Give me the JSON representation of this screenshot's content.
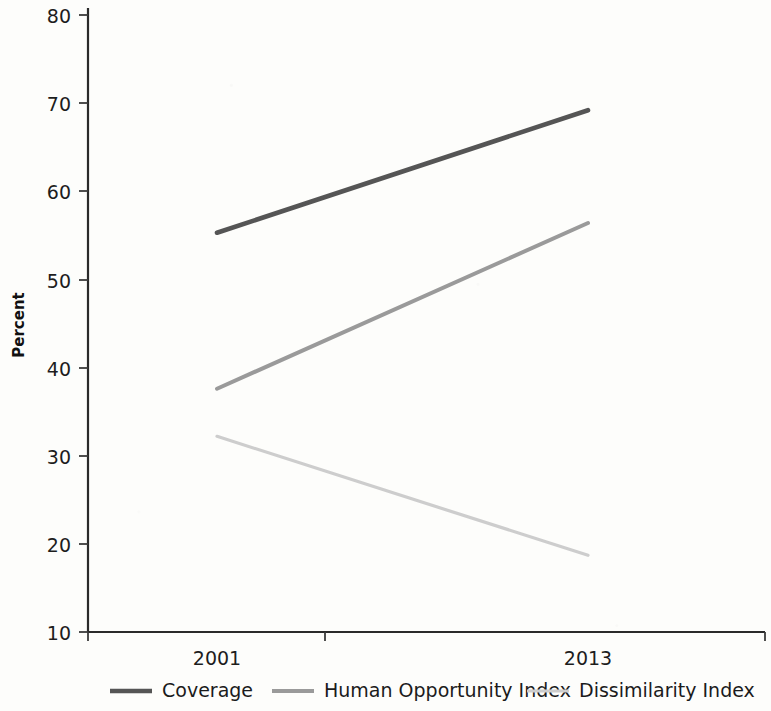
{
  "chart_data": {
    "type": "line",
    "title": "",
    "subtitle": "",
    "xlabel": "",
    "ylabel": "Percent",
    "categories": [
      "2001",
      "2013"
    ],
    "x": [
      2001,
      2013
    ],
    "xlim": [
      2001,
      2013
    ],
    "ylim": [
      10,
      80
    ],
    "ytick_labels": [
      "10",
      "20",
      "30",
      "40",
      "50",
      "60",
      "70",
      "80"
    ],
    "yticks": [
      10,
      20,
      30,
      40,
      50,
      60,
      70,
      80
    ],
    "xtick_labels": [
      "2001",
      "2013"
    ],
    "grid": false,
    "legend_position": "bottom",
    "series": [
      {
        "name": "Coverage",
        "values": [
          55.3,
          69.2
        ],
        "color": "#555555"
      },
      {
        "name": "Human Opportunity Index",
        "values": [
          37.6,
          56.4
        ],
        "color": "#9a9a9a"
      },
      {
        "name": "Dissimilarity Index",
        "values": [
          32.2,
          18.7
        ],
        "color": "#cdcdcd"
      }
    ]
  },
  "axes": {
    "y_title": "Percent",
    "y_ticks": [
      {
        "label": "80",
        "value": 80
      },
      {
        "label": "70",
        "value": 70
      },
      {
        "label": "60",
        "value": 60
      },
      {
        "label": "50",
        "value": 50
      },
      {
        "label": "40",
        "value": 40
      },
      {
        "label": "30",
        "value": 30
      },
      {
        "label": "20",
        "value": 20
      },
      {
        "label": "10",
        "value": 10
      }
    ],
    "x_ticks": [
      {
        "label": "2001",
        "value": 2001
      },
      {
        "label": "2013",
        "value": 2013
      }
    ]
  },
  "legend": {
    "items": [
      {
        "label": "Coverage",
        "color": "#555555",
        "thickness": 4.6
      },
      {
        "label": "Human Opportunity Index",
        "color": "#9a9a9a",
        "thickness": 4.0
      },
      {
        "label": "Dissimilarity Index",
        "color": "#cdcdcd",
        "thickness": 3.2
      }
    ]
  }
}
